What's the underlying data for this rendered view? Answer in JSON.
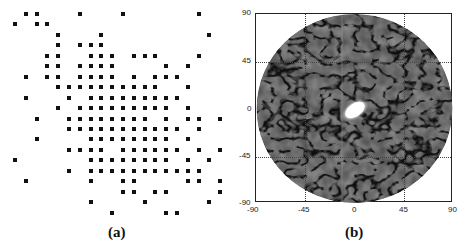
{
  "chart_data": [
    {
      "type": "scatter",
      "panel": "a",
      "title": "",
      "caption": "(a)",
      "description": "Sparse array element layout on a 20x20 grid (filled squares = active elements)",
      "grid": {
        "columns": 20,
        "rows": 20
      },
      "rows": [
        {
          "row": 0,
          "cols": [
            1,
            2,
            6,
            10,
            17
          ]
        },
        {
          "row": 1,
          "cols": [
            0,
            2,
            3
          ]
        },
        {
          "row": 2,
          "cols": [
            4,
            8,
            18
          ]
        },
        {
          "row": 3,
          "cols": [
            4,
            6,
            7,
            8
          ]
        },
        {
          "row": 4,
          "cols": [
            3,
            4,
            7,
            8,
            9,
            11,
            12,
            13,
            17
          ]
        },
        {
          "row": 5,
          "cols": [
            3,
            4,
            6,
            7,
            8,
            9,
            14,
            16
          ]
        },
        {
          "row": 6,
          "cols": [
            1,
            3,
            4,
            6,
            7,
            8,
            9,
            11,
            13,
            14,
            15
          ]
        },
        {
          "row": 7,
          "cols": [
            4,
            5,
            6,
            7,
            8,
            9,
            10,
            11,
            12,
            13,
            16
          ]
        },
        {
          "row": 8,
          "cols": [
            1,
            5,
            7,
            8,
            9,
            10,
            11,
            12,
            13,
            14,
            15
          ]
        },
        {
          "row": 9,
          "cols": [
            4,
            6,
            7,
            8,
            9,
            10,
            11,
            12,
            13,
            14,
            16
          ]
        },
        {
          "row": 10,
          "cols": [
            2,
            5,
            6,
            7,
            8,
            9,
            10,
            11,
            12,
            14,
            16,
            17,
            19
          ]
        },
        {
          "row": 11,
          "cols": [
            5,
            6,
            7,
            8,
            9,
            10,
            11,
            12,
            13,
            14,
            15,
            17
          ]
        },
        {
          "row": 12,
          "cols": [
            2,
            7,
            8,
            9,
            10,
            11,
            12,
            13,
            14,
            16
          ]
        },
        {
          "row": 13,
          "cols": [
            5,
            6,
            7,
            8,
            10,
            11,
            12,
            13,
            14,
            15,
            17,
            19
          ]
        },
        {
          "row": 14,
          "cols": [
            0,
            7,
            8,
            9,
            10,
            11,
            12,
            13,
            14,
            16,
            18
          ]
        },
        {
          "row": 15,
          "cols": [
            5,
            7,
            8,
            9,
            10,
            11,
            12,
            13,
            14,
            15,
            16,
            17
          ]
        },
        {
          "row": 16,
          "cols": [
            1,
            7,
            10,
            11,
            16,
            17,
            19
          ]
        },
        {
          "row": 17,
          "cols": [
            10,
            11,
            13,
            14,
            19
          ]
        },
        {
          "row": 18,
          "cols": [
            7,
            12,
            18
          ]
        },
        {
          "row": 19,
          "cols": [
            9,
            14,
            15
          ]
        }
      ]
    },
    {
      "type": "heatmap",
      "panel": "b",
      "title": "",
      "caption": "(b)",
      "description": "Beam pattern over a circular visible region; bright main lobe at center, speckled side-lobe floor",
      "xlim": [
        -90,
        90
      ],
      "ylim": [
        -90,
        90
      ],
      "xticks": [
        -90,
        -45,
        0,
        45,
        90
      ],
      "yticks": [
        90,
        45,
        0,
        -45,
        -90
      ],
      "grid": "dotted at ±45",
      "main_lobe": {
        "x": 0,
        "y": 0,
        "color": "#ffffff"
      },
      "colormap": "grayscale",
      "background_level_color": "#3a3a3a"
    }
  ],
  "panel_a": {
    "caption": "(a)"
  },
  "panel_b": {
    "caption": "(b)",
    "xticks": [
      "-90",
      "-45",
      "0",
      "45",
      "90"
    ],
    "yticks": [
      "90",
      "45",
      "0",
      "-45",
      "-90"
    ]
  }
}
